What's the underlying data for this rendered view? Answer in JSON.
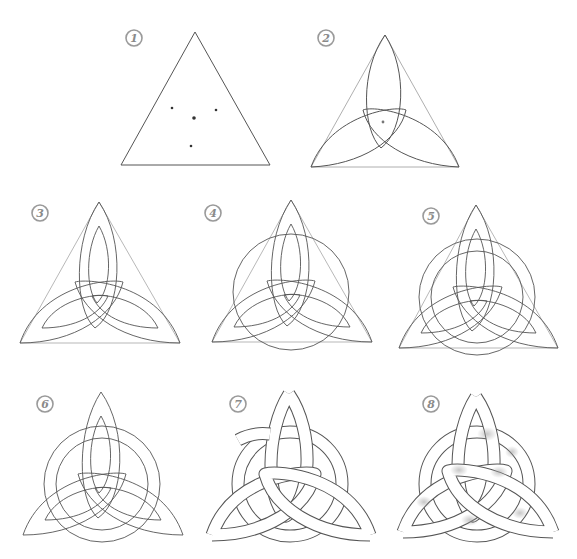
{
  "top_caption_fragment": "drawing guide steps",
  "colors": {
    "background": "#ffffff",
    "line": "#555555",
    "guide_line": "#9a9a9a",
    "badge": "#8a8a8a",
    "shading": "#b8b8b8"
  },
  "steps": [
    {
      "number": "1",
      "description": "Equilateral triangle with center point and three marker dots"
    },
    {
      "number": "2",
      "description": "Three arcs from the vertices forming the outer triquetra petals"
    },
    {
      "number": "3",
      "description": "Inner parallel arcs added to give petals thickness"
    },
    {
      "number": "4",
      "description": "Outer circle drawn around the center"
    },
    {
      "number": "5",
      "description": "Second inner concentric circle added"
    },
    {
      "number": "6",
      "description": "Triangle guide lines removed"
    },
    {
      "number": "7",
      "description": "Over-under interlacing; hidden lines erased"
    },
    {
      "number": "8",
      "description": "Final shading applied"
    }
  ]
}
